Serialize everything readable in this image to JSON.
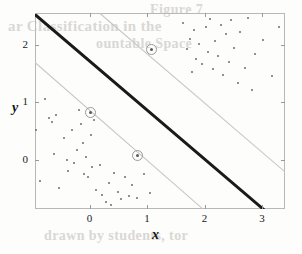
{
  "figure": {
    "width": 302,
    "height": 254,
    "background_color": "#fdfdfc"
  },
  "bleed_text": {
    "line1": "Figure 7",
    "line2": "ar Classification in the",
    "line3": "ountable Space",
    "line4": "drawn by students, tor"
  },
  "colors": {
    "boundary": "#1a1a1a",
    "margin": "#c6c6c6",
    "point": "#6b6b6b",
    "support_vector_ring": "#9b9b9b",
    "axis": "#b8b8b8",
    "text": "#222222"
  },
  "chart_data": {
    "type": "scatter",
    "title": "",
    "subtitle": "",
    "xlabel": "x",
    "ylabel": "y",
    "xlim": [
      -0.95,
      3.4
    ],
    "ylim": [
      -0.85,
      2.55
    ],
    "xticks": [
      0,
      1,
      2,
      3
    ],
    "xticklabels": [
      "0",
      "1",
      "2",
      "3"
    ],
    "yticks": [
      0,
      1,
      2
    ],
    "yticklabels": [
      "0",
      "1",
      "2"
    ],
    "grid": false,
    "legend": null,
    "legend_position": "none",
    "series": [
      {
        "name": "class-negative",
        "marker": "dot",
        "color": "#6b6b6b",
        "points": [
          [
            -0.93,
            0.52
          ],
          [
            -0.86,
            -0.37
          ],
          [
            -0.78,
            1.05
          ],
          [
            -0.7,
            0.73
          ],
          [
            -0.66,
            0.66
          ],
          [
            -0.62,
            0.1
          ],
          [
            -0.58,
            0.78
          ],
          [
            -0.54,
            -0.48
          ],
          [
            -0.45,
            0.38
          ],
          [
            -0.4,
            0.0
          ],
          [
            -0.38,
            -0.19
          ],
          [
            -0.3,
            0.52
          ],
          [
            -0.28,
            -0.06
          ],
          [
            -0.22,
            0.18
          ],
          [
            -0.18,
            0.86
          ],
          [
            -0.15,
            0.63
          ],
          [
            -0.12,
            0.3
          ],
          [
            -0.1,
            -0.25
          ],
          [
            -0.06,
            0.05
          ],
          [
            -0.02,
            -0.3
          ],
          [
            0.02,
            0.44
          ],
          [
            0.05,
            -0.12
          ],
          [
            0.08,
            0.7
          ],
          [
            0.12,
            -0.52
          ],
          [
            0.18,
            -0.08
          ],
          [
            0.22,
            -0.6
          ],
          [
            0.28,
            -0.72
          ],
          [
            0.34,
            -0.4
          ],
          [
            0.38,
            -0.78
          ],
          [
            0.42,
            -0.22
          ],
          [
            0.5,
            -0.55
          ],
          [
            0.55,
            -0.68
          ],
          [
            0.62,
            -0.3
          ],
          [
            0.68,
            -0.62
          ],
          [
            0.74,
            -0.44
          ],
          [
            0.82,
            -0.66
          ],
          [
            0.95,
            -0.25
          ],
          [
            1.05,
            -0.58
          ]
        ]
      },
      {
        "name": "class-positive",
        "marker": "dot",
        "color": "#6b6b6b",
        "points": [
          [
            1.62,
            2.38
          ],
          [
            1.7,
            1.92
          ],
          [
            1.74,
            2.1
          ],
          [
            1.78,
            1.52
          ],
          [
            1.82,
            2.26
          ],
          [
            1.86,
            1.75
          ],
          [
            1.9,
            2.02
          ],
          [
            1.95,
            1.66
          ],
          [
            2.02,
            2.3
          ],
          [
            2.06,
            1.88
          ],
          [
            2.1,
            2.44
          ],
          [
            2.14,
            1.58
          ],
          [
            2.18,
            2.06
          ],
          [
            2.24,
            1.8
          ],
          [
            2.28,
            2.34
          ],
          [
            2.32,
            1.48
          ],
          [
            2.38,
            2.18
          ],
          [
            2.42,
            1.7
          ],
          [
            2.46,
            2.42
          ],
          [
            2.52,
            1.94
          ],
          [
            2.58,
            1.34
          ],
          [
            2.62,
            2.22
          ],
          [
            2.7,
            1.6
          ],
          [
            2.76,
            2.46
          ],
          [
            2.82,
            1.22
          ],
          [
            2.88,
            1.84
          ],
          [
            3.02,
            2.08
          ],
          [
            3.18,
            1.46
          ],
          [
            3.3,
            2.3
          ]
        ]
      },
      {
        "name": "support-vectors",
        "marker": "circled-dot",
        "color": "#9b9b9b",
        "points": [
          [
            1.07,
            1.92
          ],
          [
            0.02,
            0.82
          ],
          [
            0.83,
            0.08
          ]
        ]
      }
    ],
    "lines": [
      {
        "name": "decision-boundary",
        "style": "solid-thick",
        "color": "#1a1a1a",
        "from": [
          -0.95,
          2.55
        ],
        "to": [
          3.05,
          -0.85
        ]
      },
      {
        "name": "margin-upper",
        "style": "solid-thin",
        "color": "#c6c6c6",
        "from": [
          0.18,
          2.55
        ],
        "to": [
          3.4,
          -0.2
        ]
      },
      {
        "name": "margin-lower",
        "style": "solid-thin",
        "color": "#c6c6c6",
        "from": [
          -0.95,
          1.7
        ],
        "to": [
          1.98,
          -0.85
        ]
      }
    ]
  }
}
